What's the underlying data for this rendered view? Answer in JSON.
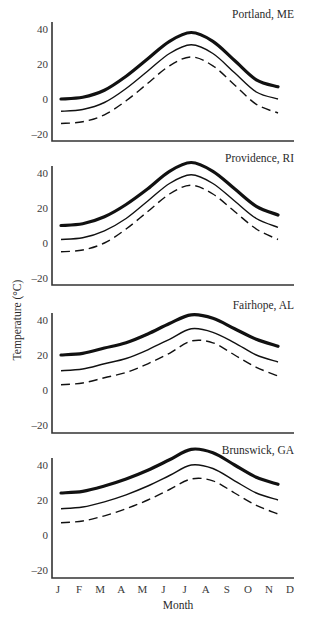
{
  "chart_data": {
    "type": "line",
    "ylabel": "Temperature (°C)",
    "xlabel": "Month",
    "x_tick_labels": [
      "J",
      "F",
      "M",
      "A",
      "M",
      "J",
      "J",
      "A",
      "S",
      "O",
      "N",
      "D"
    ],
    "y_ticks": [
      40,
      20,
      0,
      -20
    ],
    "grid": false,
    "legend": null,
    "series_styles": {
      "max": "thick solid",
      "mean": "thin solid",
      "min": "dashed"
    },
    "x": [
      "J",
      "F",
      "M",
      "A",
      "M",
      "J",
      "J",
      "A",
      "S",
      "O",
      "N"
    ],
    "panels": [
      {
        "title": "Portland, ME",
        "ylim": [
          -20,
          45
        ],
        "series": [
          {
            "name": "max",
            "values": [
              0,
              1,
              5,
              13,
              23,
              33,
              38,
              33,
              22,
              11,
              7
            ]
          },
          {
            "name": "mean",
            "values": [
              -7,
              -6,
              -2,
              6,
              16,
              26,
              31,
              26,
              15,
              4,
              0
            ]
          },
          {
            "name": "min",
            "values": [
              -14,
              -13,
              -9,
              -1,
              9,
              19,
              24,
              19,
              8,
              -3,
              -8
            ]
          }
        ]
      },
      {
        "title": "Providence, RI",
        "ylim": [
          -20,
          45
        ],
        "series": [
          {
            "name": "max",
            "values": [
              10,
              11,
              15,
              22,
              31,
              41,
              46,
              41,
              31,
              21,
              16
            ]
          },
          {
            "name": "mean",
            "values": [
              2,
              3,
              7,
              14,
              24,
              34,
              39,
              34,
              24,
              14,
              9
            ]
          },
          {
            "name": "min",
            "values": [
              -5,
              -4,
              0,
              8,
              18,
              28,
              33,
              28,
              18,
              8,
              2
            ]
          }
        ]
      },
      {
        "title": "Fairhope, AL",
        "ylim": [
          -20,
          45
        ],
        "series": [
          {
            "name": "max",
            "values": [
              20,
              21,
              24,
              27,
              32,
              38,
              43,
              41,
              35,
              29,
              25
            ]
          },
          {
            "name": "mean",
            "values": [
              11,
              12,
              15,
              18,
              23,
              29,
              35,
              33,
              27,
              20,
              16
            ]
          },
          {
            "name": "min",
            "values": [
              3,
              4,
              7,
              10,
              15,
              21,
              28,
              27,
              20,
              13,
              8
            ]
          }
        ]
      },
      {
        "title": "Brunswick, GA",
        "ylim": [
          -20,
          45
        ],
        "series": [
          {
            "name": "max",
            "values": [
              24,
              25,
              28,
              32,
              37,
              43,
              49,
              47,
              40,
              33,
              29
            ]
          },
          {
            "name": "mean",
            "values": [
              15,
              16,
              19,
              23,
              28,
              34,
              40,
              38,
              31,
              24,
              20
            ]
          },
          {
            "name": "min",
            "values": [
              7,
              8,
              11,
              15,
              20,
              26,
              32,
              31,
              24,
              17,
              12
            ]
          }
        ]
      }
    ]
  },
  "layout": {
    "panels": [
      {
        "zero_y": 99,
        "axis_top": 22,
        "axis_bottom": 141
      },
      {
        "zero_y": 243,
        "axis_top": 166,
        "axis_bottom": 285
      },
      {
        "zero_y": 390,
        "axis_top": 313,
        "axis_bottom": 433
      },
      {
        "zero_y": 535,
        "axis_top": 458,
        "axis_bottom": 578
      }
    ],
    "px_per_unit": 1.75,
    "axis_x": 52,
    "axis_right": 294,
    "first_month_x": 61,
    "month_step": 21.7,
    "label_first_x": 58,
    "label_step": 21.1
  }
}
